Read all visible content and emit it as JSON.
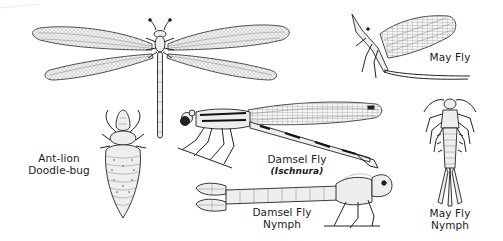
{
  "figure": {
    "background": "#ffffff",
    "ink_color": "#222222",
    "specimens": [
      {
        "id": "antlion-adult",
        "label": ""
      },
      {
        "id": "antlion-larva",
        "label_lines": [
          "Ant-lion",
          "Doodle-bug"
        ]
      },
      {
        "id": "damselfly-adult",
        "label": "Damsel Fly",
        "sublabel": "(Ischnura)"
      },
      {
        "id": "damselfly-nymph",
        "label_lines": [
          "Damsel Fly",
          "Nymph"
        ]
      },
      {
        "id": "mayfly-adult",
        "label": "May Fly"
      },
      {
        "id": "mayfly-nymph",
        "label_lines": [
          "May Fly",
          "Nymph"
        ]
      }
    ]
  }
}
